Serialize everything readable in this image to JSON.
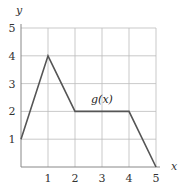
{
  "chart_data": {
    "type": "line",
    "title": "",
    "xlabel": "x",
    "ylabel": "y",
    "xlim": [
      0,
      5
    ],
    "ylim": [
      0,
      5
    ],
    "grid": true,
    "x_ticks": [
      "1",
      "2",
      "3",
      "4",
      "5"
    ],
    "y_ticks": [
      "1",
      "2",
      "3",
      "4",
      "5"
    ],
    "series": [
      {
        "name": "g(x)",
        "x": [
          0,
          1,
          2,
          4,
          5
        ],
        "values": [
          1,
          4,
          2,
          2,
          0
        ]
      }
    ],
    "annotations": [
      {
        "text": "g(x)",
        "x": 3,
        "y": 2.3
      }
    ],
    "colors": {
      "line": "#555555",
      "grid": "#bbbbbb",
      "axis": "#888888"
    }
  }
}
